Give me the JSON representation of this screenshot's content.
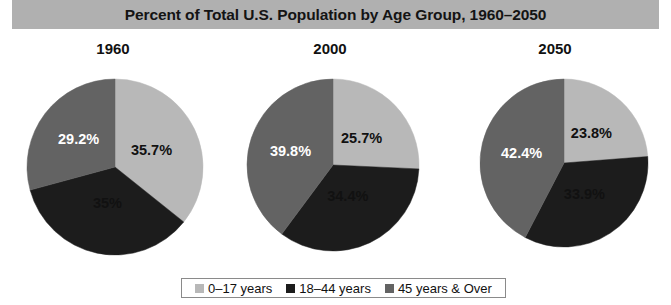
{
  "header": {
    "title": "Percent of Total U.S. Population by Age Group, 1960–2050"
  },
  "colors": {
    "title_band": "#b0b0b0",
    "age_0_17": "#b8b8b8",
    "age_18_44": "#1c1c1c",
    "age_45_over": "#636363",
    "background": "#ffffff",
    "legend_border": "#8a8a8a"
  },
  "legend": {
    "items": [
      {
        "label": "0–17 years",
        "color": "#b8b8b8",
        "swatch_name": "legend-swatch-0-17"
      },
      {
        "label": "18–44 years",
        "color": "#1c1c1c",
        "swatch_name": "legend-swatch-18-44"
      },
      {
        "label": "45 years & Over",
        "color": "#636363",
        "swatch_name": "legend-swatch-45-over"
      }
    ]
  },
  "chart_data": {
    "type": "pie",
    "title": "Percent of Total U.S. Population by Age Group, 1960–2050",
    "xlabel": "",
    "ylabel": "",
    "legend_position": "bottom",
    "grid": false,
    "categories": [
      "0–17 years",
      "18–44 years",
      "45 years & Over"
    ],
    "category_colors": [
      "#b8b8b8",
      "#1c1c1c",
      "#636363"
    ],
    "panels": [
      {
        "year": "1960",
        "values": [
          35.7,
          35.0,
          29.2
        ],
        "labels": [
          "35.7%",
          "35%",
          "29.2%"
        ]
      },
      {
        "year": "2000",
        "values": [
          25.7,
          34.4,
          39.8
        ],
        "labels": [
          "25.7%",
          "34.4%",
          "39.8%"
        ]
      },
      {
        "year": "2050",
        "values": [
          23.8,
          33.9,
          42.4
        ],
        "labels": [
          "23.8%",
          "33.9%",
          "42.4%"
        ]
      }
    ]
  }
}
